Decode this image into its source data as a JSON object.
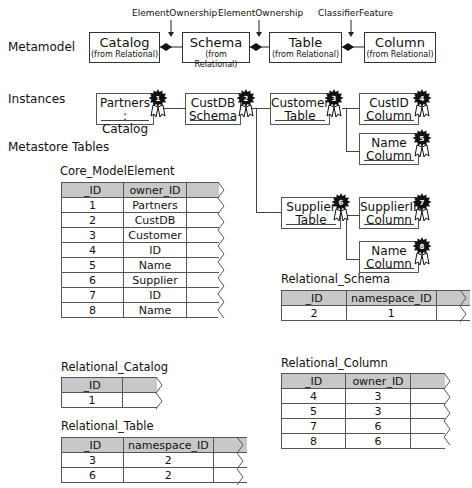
{
  "sections": {
    "metamodel": "Metamodel",
    "instances": "Instances",
    "metastore_tables": "Metastore Tables"
  },
  "metamodel": {
    "classes": [
      {
        "name": "Catalog",
        "package": "(from Relational)"
      },
      {
        "name": "Schema",
        "package": "(from Relational)"
      },
      {
        "name": "Table",
        "package": "(from Relational)"
      },
      {
        "name": "Column",
        "package": "(from Relational)"
      }
    ],
    "associations": [
      {
        "label": "ElementOwnership",
        "from": "Catalog",
        "to": "Schema"
      },
      {
        "label": "ElementOwnership",
        "from": "Schema",
        "to": "Table"
      },
      {
        "label": "ClassifierFeature",
        "from": "Table",
        "to": "Column"
      }
    ]
  },
  "instances": [
    {
      "id": "1",
      "line1": "Partners :",
      "line2": "Catalog"
    },
    {
      "id": "2",
      "line1": "CustDB",
      "line2": "Schema"
    },
    {
      "id": "3",
      "line1": "Customer",
      "line2": "Table"
    },
    {
      "id": "4",
      "line1": "CustID",
      "line2": "Column"
    },
    {
      "id": "5",
      "line1": "Name",
      "line2": "Column"
    },
    {
      "id": "6",
      "line1": "Supplier",
      "line2": "Table"
    },
    {
      "id": "7",
      "line1": "SupplierID",
      "line2": "Column"
    },
    {
      "id": "8",
      "line1": "Name",
      "line2": "Column"
    }
  ],
  "tables": {
    "core_model_element": {
      "title": "Core_ModelElement",
      "headers": [
        "_ID",
        "owner_ID"
      ],
      "rows": [
        [
          "1",
          "Partners"
        ],
        [
          "2",
          "CustDB"
        ],
        [
          "3",
          "Customer"
        ],
        [
          "4",
          "ID"
        ],
        [
          "5",
          "Name"
        ],
        [
          "6",
          "Supplier"
        ],
        [
          "7",
          "ID"
        ],
        [
          "8",
          "Name"
        ]
      ]
    },
    "relational_schema": {
      "title": "Relational_Schema",
      "headers": [
        "_ID",
        "namespace_ID"
      ],
      "rows": [
        [
          "2",
          "1"
        ]
      ]
    },
    "relational_catalog": {
      "title": "Relational_Catalog",
      "headers": [
        "_ID"
      ],
      "rows": [
        [
          "1"
        ]
      ]
    },
    "relational_column": {
      "title": "Relational_Column",
      "headers": [
        "_ID",
        "owner_ID"
      ],
      "rows": [
        [
          "4",
          "3"
        ],
        [
          "5",
          "3"
        ],
        [
          "7",
          "6"
        ],
        [
          "8",
          "6"
        ]
      ]
    },
    "relational_table": {
      "title": "Relational_Table",
      "headers": [
        "_ID",
        "namespace_ID"
      ],
      "rows": [
        [
          "3",
          "2"
        ],
        [
          "6",
          "2"
        ]
      ]
    }
  },
  "colors": {
    "header_fill": "#c8c8c8",
    "line": "#444444",
    "rosette": "#111111"
  }
}
